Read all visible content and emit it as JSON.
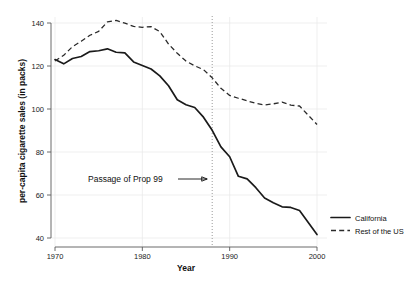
{
  "chart_data": {
    "type": "line",
    "title": "",
    "xlabel": "Year",
    "ylabel": "per-capita cigarette sales (in packs)",
    "xlim": [
      1970,
      2000
    ],
    "ylim": [
      40,
      140
    ],
    "xticks": [
      1970,
      1980,
      1990,
      2000
    ],
    "yticks": [
      40,
      60,
      80,
      100,
      120,
      140
    ],
    "xtick_labels": [
      "1970",
      "1980",
      "1990",
      "2000"
    ],
    "ytick_labels": [
      "40",
      "60",
      "80",
      "100",
      "120",
      "140"
    ],
    "grid": true,
    "legend_position": "right-bottom",
    "x": [
      1970,
      1971,
      1972,
      1973,
      1974,
      1975,
      1976,
      1977,
      1978,
      1979,
      1980,
      1981,
      1982,
      1983,
      1984,
      1985,
      1986,
      1987,
      1988,
      1989,
      1990,
      1991,
      1992,
      1993,
      1994,
      1995,
      1996,
      1997,
      1998,
      1999,
      2000
    ],
    "series": [
      {
        "name": "California",
        "style": "solid",
        "color": "#1a1a1a",
        "values": [
          123.0,
          121.0,
          123.5,
          124.4,
          126.7,
          127.1,
          128.0,
          126.4,
          126.1,
          121.9,
          120.2,
          118.6,
          115.4,
          110.8,
          104.3,
          102.0,
          100.7,
          96.2,
          90.1,
          82.4,
          77.8,
          68.7,
          67.5,
          63.4,
          58.6,
          56.4,
          54.5,
          54.2,
          52.8,
          47.2,
          41.6
        ]
      },
      {
        "name": "Rest of the US",
        "style": "dashed",
        "color": "#2a2a2a",
        "values": [
          122.3,
          125.0,
          129.0,
          131.5,
          134.3,
          136.1,
          140.5,
          141.2,
          139.9,
          138.4,
          138.0,
          138.3,
          136.0,
          130.2,
          125.9,
          122.3,
          120.1,
          118.3,
          114.5,
          109.6,
          106.3,
          105.0,
          103.8,
          102.6,
          101.9,
          102.4,
          103.2,
          101.8,
          101.4,
          97.1,
          92.8
        ]
      }
    ],
    "annotations": [
      {
        "text": "Passage of Prop 99",
        "arrow": "⟶",
        "x": 1988,
        "kind": "vertical-line-with-label"
      }
    ],
    "vertical_line_year": 1988
  },
  "legend": {
    "items": [
      {
        "label": "California",
        "style": "solid"
      },
      {
        "label": "Rest of the US",
        "style": "dashed"
      }
    ]
  },
  "colors": {
    "background": "#ffffff",
    "axis": "#5a5a5a",
    "grid": "#e8e8e8",
    "text": "#111111",
    "vline": "#9a9a9a"
  }
}
